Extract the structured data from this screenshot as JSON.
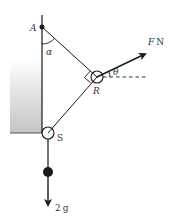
{
  "diagram": {
    "type": "mechanics-pulley-system",
    "labels": {
      "point_a": "A",
      "point_r": "R",
      "point_s": "S",
      "angle_alpha": "α",
      "angle_theta": "θ",
      "force_label_var": "F",
      "force_label_unit": "N",
      "weight_label_num": "2",
      "weight_label_unit": "g"
    },
    "colors": {
      "line": "#1a1a1a",
      "wall_top": "#ffffff",
      "wall_bottom": "#c8c8c8",
      "text": "#333333"
    }
  }
}
